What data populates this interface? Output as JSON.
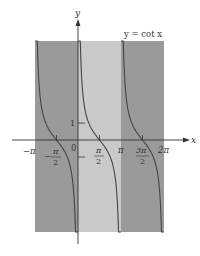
{
  "chart_data": {
    "type": "line",
    "title": "y = cot x",
    "function": "cot(x)",
    "xlabel": "x",
    "ylabel": "y",
    "x_ticks": [
      "-π",
      "-π/2",
      "0",
      "π/2",
      "π",
      "3π/2",
      "2π"
    ],
    "x_tick_values": [
      -3.1416,
      -1.5708,
      0,
      1.5708,
      3.1416,
      4.7124,
      6.2832
    ],
    "y_ticks": [
      "1"
    ],
    "y_tick_values": [
      1
    ],
    "xlim": [
      -3.6,
      6.9
    ],
    "ylim": [
      -5.6,
      7.0
    ],
    "asymptotes": [
      -3.1416,
      0,
      3.1416,
      6.2832
    ],
    "branches": [
      {
        "domain": [
          -3.1416,
          0
        ],
        "shade": "dark"
      },
      {
        "domain": [
          0,
          3.1416
        ],
        "shade": "light"
      },
      {
        "domain": [
          3.1416,
          6.2832
        ],
        "shade": "dark"
      }
    ],
    "zeros": [
      -1.5708,
      1.5708,
      4.7124
    ],
    "grid": false,
    "legend": "none"
  },
  "labels": {
    "title": "y = cot x",
    "x_axis": "x",
    "y_axis": "y",
    "neg_pi": "−π",
    "neg_half_pi_num": "π",
    "neg_sign": "−",
    "two": "2",
    "zero": "0",
    "half_pi_num": "π",
    "pi": "π",
    "three_pi_num": "3π",
    "two_pi": "2π",
    "one": "1"
  },
  "colors": {
    "dark_band": "#9a9a9a",
    "light_band": "#c8c8c8",
    "curve": "#444444",
    "axis": "#333333"
  }
}
